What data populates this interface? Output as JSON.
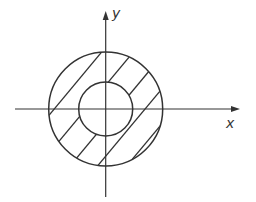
{
  "diagram": {
    "type": "annulus-region-on-axes",
    "axes": {
      "x_label": "x",
      "y_label": "y"
    },
    "outer_circle": {
      "center": [
        0,
        0
      ],
      "relative_radius": 2
    },
    "inner_circle": {
      "center": [
        0,
        0
      ],
      "relative_radius": 1
    },
    "shaded_region": "annulus between inner and outer circles (diagonal hatching)",
    "colors": {
      "stroke": "#333333",
      "background": "#ffffff"
    }
  }
}
